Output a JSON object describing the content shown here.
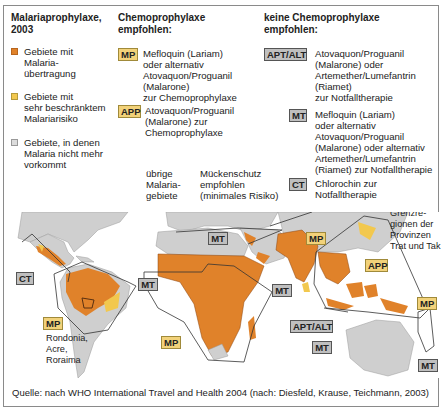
{
  "colors": {
    "transmission": "#e0822a",
    "limited_risk": "#f2c84e",
    "no_malaria": "#d6d6d6",
    "badge_yellow": "#f2d27a",
    "badge_gray": "#bfbfbf",
    "land_gray": "#cfcfcf"
  },
  "legend": {
    "title": "Malariaprophylaxe,\n2003",
    "items": [
      {
        "label": "Gebiete mit\nMalaria-\nübertragung",
        "swatch": "transmission-swatch"
      },
      {
        "label": "Gebiete mit\nsehr beschränktem\nMalariarisiko",
        "swatch": "limited-risk-swatch"
      },
      {
        "label": "Gebiete, in denen\nMalaria nicht mehr\nvorkommt",
        "swatch": "no-malaria-swatch"
      }
    ]
  },
  "chemo": {
    "title": "Chemoprophylaxe\nempfohlen:",
    "items": [
      {
        "badge": "MP",
        "text": "Mefloquin (Lariam)\noder alternativ\nAtovaquon/Proguanil\n(Malarone)\nzur Chemoprophylaxe"
      },
      {
        "badge": "APP",
        "text": "Atovaquon/Proguanil\n(Malarone) zur\nChemoprophylaxe"
      }
    ]
  },
  "no_chemo": {
    "title": "keine Chemoprophylaxe\nempfohlen:",
    "items": [
      {
        "badge": "APT/ALT",
        "text": "Atovaquon/Proguanil\n(Malarone) oder\nArtemether/Lumefantrin\n(Riamet)\nzur Notfalltherapie"
      },
      {
        "badge": "MT",
        "text": "Mefloquin (Lariam)\noder alternativ\nAtovaquon/Proguanil\n(Malarone) oder alternativ\nArtemether/Lumefantrin\n(Riamet) zur Notfalltherapie"
      },
      {
        "badge": "CT",
        "text": "Chlorochin zur\nNotfalltherapie"
      }
    ]
  },
  "other_areas": {
    "label": "übrige\nMalaria-\ngebiete",
    "note": "Mückenschutz\nempfohlen\n(minimales Risiko)"
  },
  "map": {
    "badges": [
      {
        "id": "americas-ct",
        "text": "CT"
      },
      {
        "id": "americas-mt",
        "text": "MT"
      },
      {
        "id": "americas-mp",
        "text": "MP"
      },
      {
        "id": "mediterranean-mt",
        "text": "MT"
      },
      {
        "id": "africa-mp",
        "text": "MP"
      },
      {
        "id": "asia-mp",
        "text": "MP"
      },
      {
        "id": "thailand-app",
        "text": "APP"
      },
      {
        "id": "srilanka-mt",
        "text": "MT"
      },
      {
        "id": "indonesia-apt-alt",
        "text": "APT/ALT"
      },
      {
        "id": "indonesia-mt",
        "text": "MT"
      },
      {
        "id": "pacific-mp",
        "text": "MP"
      },
      {
        "id": "vanuatu-mt",
        "text": "MT"
      }
    ],
    "labels": {
      "brazil_regions": "Rondonia,\nAcre,\nRoraima",
      "thai_border": "Grenzre-\ngionen der\nProvinzen\nTrat und Tak"
    }
  },
  "source": "Quelle: nach WHO International Travel and Health 2004 (nach: Diesfeld, Krause, Teichmann, 2003)"
}
